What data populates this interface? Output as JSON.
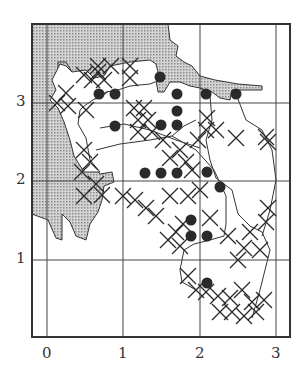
{
  "map": {
    "axes": {
      "x_ticks": [
        {
          "label": "0",
          "px": 47
        },
        {
          "label": "1",
          "px": 123
        },
        {
          "label": "2",
          "px": 200
        },
        {
          "label": "3",
          "px": 276
        }
      ],
      "y_ticks": [
        {
          "label": "3",
          "px": 103
        },
        {
          "label": "2",
          "px": 181
        },
        {
          "label": "1",
          "px": 260
        }
      ]
    },
    "frame": {
      "x1": 32,
      "y1": 24,
      "x2": 290,
      "y2": 337
    },
    "colors": {
      "ink": "#2a2a2a",
      "shade": "#bdbdbd",
      "background": "#ffffff"
    },
    "legend_symbols": {
      "dot": "filled-circle-record",
      "cross": "x-record"
    },
    "dots": [
      [
        99,
        94
      ],
      [
        115,
        94
      ],
      [
        160,
        77
      ],
      [
        177,
        94
      ],
      [
        206,
        94
      ],
      [
        236,
        94
      ],
      [
        115,
        126
      ],
      [
        177,
        111
      ],
      [
        161,
        125
      ],
      [
        177,
        125
      ],
      [
        145,
        173
      ],
      [
        161,
        173
      ],
      [
        177,
        173
      ],
      [
        207,
        172
      ],
      [
        220,
        187
      ],
      [
        191,
        220
      ],
      [
        191,
        236
      ],
      [
        207,
        236
      ],
      [
        207,
        283
      ]
    ],
    "crosses": [
      [
        84,
        75
      ],
      [
        98,
        66
      ],
      [
        111,
        66
      ],
      [
        92,
        80
      ],
      [
        104,
        80
      ],
      [
        98,
        72
      ],
      [
        130,
        66
      ],
      [
        130,
        78
      ],
      [
        66,
        93
      ],
      [
        57,
        103
      ],
      [
        68,
        106
      ],
      [
        86,
        110
      ],
      [
        84,
        150
      ],
      [
        90,
        162
      ],
      [
        82,
        172
      ],
      [
        96,
        184
      ],
      [
        84,
        196
      ],
      [
        102,
        195
      ],
      [
        134,
        108
      ],
      [
        144,
        108
      ],
      [
        138,
        120
      ],
      [
        148,
        120
      ],
      [
        138,
        132
      ],
      [
        152,
        132
      ],
      [
        163,
        140
      ],
      [
        207,
        118
      ],
      [
        206,
        130
      ],
      [
        198,
        140
      ],
      [
        216,
        130
      ],
      [
        236,
        138
      ],
      [
        266,
        137
      ],
      [
        268,
        142
      ],
      [
        170,
        158
      ],
      [
        180,
        150
      ],
      [
        186,
        162
      ],
      [
        192,
        170
      ],
      [
        188,
        196
      ],
      [
        200,
        190
      ],
      [
        123,
        196
      ],
      [
        135,
        200
      ],
      [
        146,
        208
      ],
      [
        156,
        216
      ],
      [
        170,
        196
      ],
      [
        183,
        224
      ],
      [
        176,
        232
      ],
      [
        210,
        218
      ],
      [
        168,
        240
      ],
      [
        180,
        246
      ],
      [
        268,
        208
      ],
      [
        266,
        222
      ],
      [
        260,
        250
      ],
      [
        250,
        232
      ],
      [
        244,
        248
      ],
      [
        228,
        236
      ],
      [
        238,
        260
      ],
      [
        188,
        276
      ],
      [
        196,
        290
      ],
      [
        206,
        292
      ],
      [
        218,
        296
      ],
      [
        230,
        298
      ],
      [
        242,
        290
      ],
      [
        252,
        302
      ],
      [
        232,
        312
      ],
      [
        220,
        312
      ],
      [
        244,
        316
      ],
      [
        256,
        312
      ],
      [
        264,
        300
      ]
    ]
  }
}
